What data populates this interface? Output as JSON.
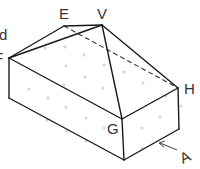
{
  "diagram": {
    "type": "isometric-solid",
    "labels": {
      "d": "d",
      "F": "F",
      "E": "E",
      "V": "V",
      "H": "H",
      "G": "G",
      "A": "A"
    },
    "vertices": {
      "F": [
        9,
        58
      ],
      "E": [
        64,
        26
      ],
      "V": [
        102,
        25
      ],
      "H": [
        178,
        88
      ],
      "G": [
        122,
        119
      ],
      "F_bottom": [
        9,
        98
      ],
      "G_bottom": [
        124,
        160
      ],
      "H_bottom": [
        179,
        129
      ]
    },
    "colors": {
      "edge": "#1a1a1a",
      "dots": "#d4d4d4",
      "text": "#333333"
    }
  }
}
